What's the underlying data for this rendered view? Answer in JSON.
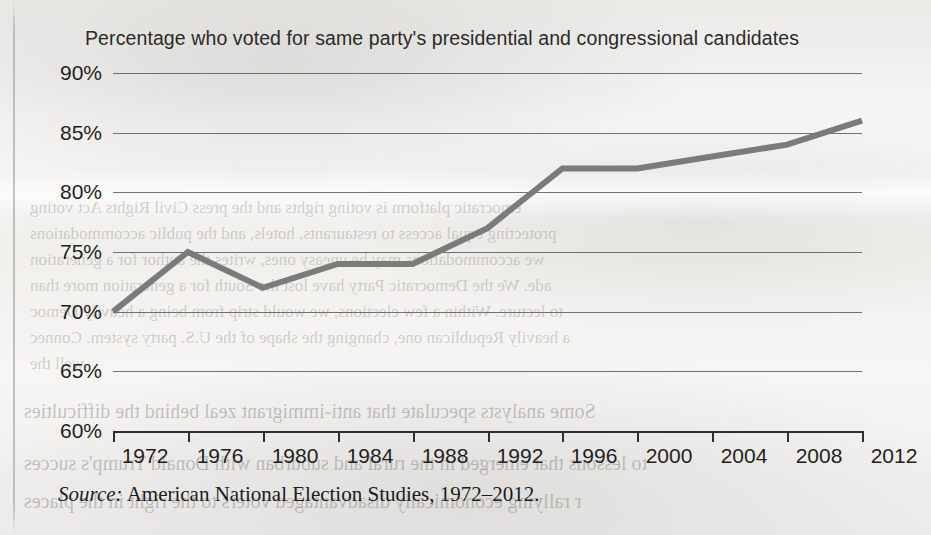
{
  "chart_data": {
    "type": "line",
    "title": "Percentage who voted for same party's presidential and congressional candidates",
    "xlabel": "",
    "ylabel": "",
    "categories": [
      "1972",
      "1976",
      "1980",
      "1984",
      "1988",
      "1992",
      "1996",
      "2000",
      "2004",
      "2008",
      "2012"
    ],
    "values": [
      70,
      75,
      72,
      74,
      74,
      77,
      82,
      82,
      83,
      84,
      86
    ],
    "x": [
      1972,
      1976,
      1980,
      1984,
      1988,
      1992,
      1996,
      2000,
      2004,
      2008,
      2012
    ],
    "ylim": [
      60,
      90
    ],
    "yticks": [
      60,
      65,
      70,
      75,
      80,
      85,
      90
    ],
    "ytick_labels": [
      "60%",
      "65%",
      "70%",
      "75%",
      "80%",
      "85%",
      "90%"
    ],
    "xlim": [
      1972,
      2012
    ],
    "grid": true,
    "legend": false,
    "series_color": "#7b7b7b",
    "gridline_color": "#5a5a5a",
    "axis_color": "#2f2f2f",
    "text_color": "#1f1f1f"
  },
  "source": {
    "label": "Source:",
    "text": "American National Election Studies, 1972–2012."
  },
  "ghost_text": [
    "emocratic platform is voting rights and the press Civil Rights Act voting",
    "protecting equal access to restaurants, hotels, and the public accommodations",
    "we accommodations may be uneasy ones, writes the author for a generation",
    "ade. We the Democratic Party have lost the South for a generation more than",
    "to lecture. Within a few elections, we would strip from being a heavily Democ",
    "a heavily Republican one, changing the shape of the U.S. party system. Connec",
    "well the",
    "Some analysts speculate that anti-immigrant zeal behind the difficulties",
    "to lessons that emerged in the rural and suburban with Donald Trump's succes",
    "r rallying economically disadvantaged voters to the right in the places"
  ]
}
